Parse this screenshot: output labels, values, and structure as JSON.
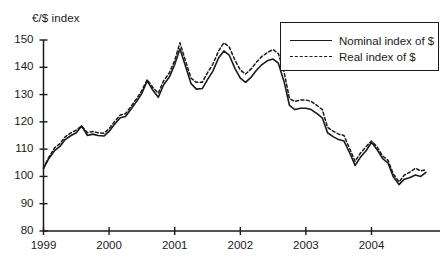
{
  "chart_data": {
    "type": "line",
    "title": "",
    "subtitle": "",
    "ylabel": "€/$ index",
    "xlabel": "",
    "ylim": [
      80,
      150
    ],
    "yticks": [
      80,
      90,
      100,
      110,
      120,
      130,
      140,
      150
    ],
    "xlim": [
      1999.0,
      2004.83
    ],
    "xticks": [
      1999,
      2000,
      2001,
      2002,
      2003,
      2004
    ],
    "xtick_labels": [
      "1999",
      "2000",
      "2001",
      "2002",
      "2003",
      "2004"
    ],
    "grid": false,
    "legend_position": "top-right",
    "line_color": "#1a1a1a",
    "background_color": "#ffffff",
    "x": [
      1999.0,
      1999.08,
      1999.17,
      1999.25,
      1999.33,
      1999.42,
      1999.5,
      1999.58,
      1999.67,
      1999.75,
      1999.83,
      1999.92,
      2000.0,
      2000.08,
      2000.17,
      2000.25,
      2000.33,
      2000.42,
      2000.5,
      2000.58,
      2000.67,
      2000.75,
      2000.83,
      2000.92,
      2001.0,
      2001.08,
      2001.17,
      2001.25,
      2001.33,
      2001.42,
      2001.5,
      2001.58,
      2001.67,
      2001.75,
      2001.83,
      2001.92,
      2002.0,
      2002.08,
      2002.17,
      2002.25,
      2002.33,
      2002.42,
      2002.5,
      2002.58,
      2002.67,
      2002.75,
      2002.83,
      2002.92,
      2003.0,
      2003.08,
      2003.17,
      2003.25,
      2003.33,
      2003.42,
      2003.5,
      2003.58,
      2003.67,
      2003.75,
      2003.83,
      2003.92,
      2004.0,
      2004.08,
      2004.17,
      2004.25,
      2004.33,
      2004.42,
      2004.5,
      2004.58,
      2004.67,
      2004.75,
      2004.83
    ],
    "series": [
      {
        "name": "Nominal index of $",
        "style": "solid",
        "values": [
          103.0,
          106.5,
          109.5,
          111.0,
          113.5,
          115.0,
          116.0,
          118.5,
          115.0,
          115.5,
          115.0,
          114.8,
          116.5,
          119.0,
          121.5,
          122.0,
          124.5,
          127.5,
          130.5,
          135.0,
          131.5,
          129.0,
          133.5,
          136.5,
          141.0,
          146.8,
          140.0,
          134.0,
          132.0,
          132.2,
          135.5,
          138.5,
          143.5,
          146.0,
          144.5,
          139.5,
          136.0,
          134.5,
          136.5,
          139.0,
          141.0,
          142.5,
          143.0,
          141.5,
          134.5,
          126.0,
          124.5,
          125.0,
          125.0,
          124.5,
          123.0,
          121.5,
          116.0,
          114.5,
          113.5,
          113.0,
          108.5,
          104.0,
          107.0,
          109.5,
          112.5,
          110.0,
          106.5,
          105.0,
          100.0,
          97.0,
          99.0,
          99.5,
          100.5,
          100.0,
          101.5
        ]
      },
      {
        "name": "Real index of $",
        "style": "dashed",
        "values": [
          103.0,
          107.0,
          110.5,
          112.0,
          114.5,
          116.0,
          117.0,
          118.5,
          116.0,
          116.5,
          116.0,
          115.8,
          117.5,
          120.0,
          122.5,
          123.0,
          125.5,
          128.5,
          131.5,
          135.5,
          132.5,
          130.5,
          135.0,
          138.0,
          142.5,
          149.0,
          142.0,
          136.0,
          134.5,
          134.5,
          138.0,
          141.0,
          146.0,
          149.0,
          147.5,
          142.5,
          139.0,
          137.5,
          139.5,
          142.0,
          144.0,
          145.5,
          146.5,
          145.0,
          138.0,
          128.5,
          127.5,
          128.0,
          128.0,
          127.5,
          126.0,
          124.5,
          118.0,
          116.5,
          115.5,
          115.0,
          110.0,
          105.5,
          108.5,
          111.0,
          113.0,
          111.0,
          107.5,
          106.0,
          101.0,
          98.0,
          100.5,
          101.5,
          103.0,
          102.0,
          102.5
        ]
      }
    ]
  },
  "legend": {
    "items": [
      {
        "label": "Nominal index of $",
        "style": "solid"
      },
      {
        "label": "Real index of $",
        "style": "dashed"
      }
    ]
  }
}
